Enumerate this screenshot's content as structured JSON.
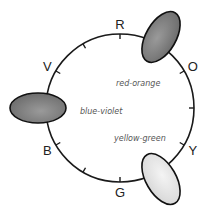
{
  "diagram": {
    "title": "",
    "type": "color-wheel",
    "positions": [
      {
        "key": "R",
        "label": "R",
        "kind": "tick"
      },
      {
        "key": "RO",
        "label": "",
        "kind": "swatch",
        "name": "red-orange",
        "fill": "#7a7a7a"
      },
      {
        "key": "O",
        "label": "O",
        "kind": "tick"
      },
      {
        "key": "YO",
        "label": "",
        "kind": "tick"
      },
      {
        "key": "Y",
        "label": "Y",
        "kind": "tick"
      },
      {
        "key": "YG",
        "label": "",
        "kind": "swatch",
        "name": "yellow-green",
        "fill": "#e2e2e2"
      },
      {
        "key": "G",
        "label": "G",
        "kind": "tick"
      },
      {
        "key": "BG",
        "label": "",
        "kind": "tick"
      },
      {
        "key": "B",
        "label": "B",
        "kind": "tick"
      },
      {
        "key": "BV",
        "label": "",
        "kind": "swatch",
        "name": "blue-violet",
        "fill": "#6e6e6e"
      },
      {
        "key": "V",
        "label": "V",
        "kind": "tick"
      },
      {
        "key": "RV",
        "label": "",
        "kind": "tick"
      }
    ],
    "swatch_labels": {
      "red_orange": "red-orange",
      "yellow_green": "yellow-green",
      "blue_violet": "blue-violet"
    }
  }
}
